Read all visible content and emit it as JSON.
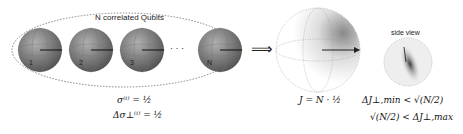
{
  "diagram": {
    "group_label": "N correlated Qubits",
    "qubits": [
      {
        "label": "1"
      },
      {
        "label": "2"
      },
      {
        "label": "3"
      },
      {
        "label": "N"
      }
    ],
    "ellipsis": "· · ·",
    "implies_symbol": "⟹",
    "side_view_label": "side view",
    "equations": {
      "sigma": "σ⁽ⁱ⁾ = ½",
      "delta_sigma": "Δσ⊥⁽ⁱ⁾ = ½",
      "J": "J = N · ½",
      "delta_J_min": "ΔJ⊥,min < √(N/2)",
      "delta_J_max": "√(N/2) < ΔJ⊥,max"
    },
    "colors": {
      "sphere_dark": "#555555",
      "sphere_light": "#bdbdbd",
      "outline": "#777777"
    }
  }
}
